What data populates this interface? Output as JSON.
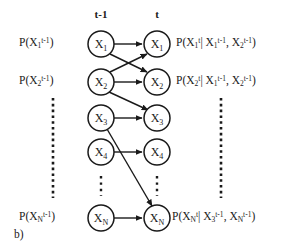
{
  "figure": {
    "caption": "b)",
    "background_color": "#ffffff",
    "stroke_color": "#1a1a1a"
  },
  "time_slices": [
    {
      "id": "previous",
      "label": "t-1",
      "x": 101
    },
    {
      "id": "current",
      "label": "t",
      "x": 157
    }
  ],
  "nodes": {
    "previous_slice": [
      {
        "name": "X",
        "subscript": "1",
        "label": "X₁",
        "cy": 44
      },
      {
        "name": "X",
        "subscript": "2",
        "label": "X₂",
        "cy": 82
      },
      {
        "name": "X",
        "subscript": "3",
        "label": "X₃",
        "cy": 118
      },
      {
        "name": "X",
        "subscript": "4",
        "label": "X₄",
        "cy": 152
      },
      {
        "name": "X",
        "subscript": "N",
        "label": "Xₙ",
        "cy": 218
      }
    ],
    "current_slice": [
      {
        "name": "X",
        "subscript": "1",
        "label": "X₁",
        "cy": 44
      },
      {
        "name": "X",
        "subscript": "2",
        "label": "X₂",
        "cy": 82
      },
      {
        "name": "X",
        "subscript": "3",
        "label": "X₃",
        "cy": 118
      },
      {
        "name": "X",
        "subscript": "4",
        "label": "X₄",
        "cy": 152
      },
      {
        "name": "X",
        "subscript": "N",
        "label": "Xₙ",
        "cy": 218
      }
    ]
  },
  "edges": [
    {
      "from": "X1_prev",
      "to": "X1_cur",
      "kind": "horizontal"
    },
    {
      "from": "X1_prev",
      "to": "X2_cur",
      "kind": "diagonal"
    },
    {
      "from": "X2_prev",
      "to": "X1_cur",
      "kind": "diagonal"
    },
    {
      "from": "X2_prev",
      "to": "X2_cur",
      "kind": "horizontal"
    },
    {
      "from": "X2_prev",
      "to": "X3_cur",
      "kind": "diagonal"
    },
    {
      "from": "X3_prev",
      "to": "X3_cur",
      "kind": "horizontal"
    },
    {
      "from": "X3_prev",
      "to": "XN_cur",
      "kind": "diagonal"
    },
    {
      "from": "X4_prev",
      "to": "X4_cur",
      "kind": "horizontal"
    },
    {
      "from": "XN_prev",
      "to": "XN_cur",
      "kind": "horizontal"
    }
  ],
  "left_labels": [
    {
      "id": "prior-x1",
      "base": "P(X",
      "sub": "1",
      "sup": "t-1",
      "close": ")"
    },
    {
      "id": "prior-x2",
      "base": "P(X",
      "sub": "2",
      "sup": "t-1",
      "close": ")"
    },
    {
      "id": "prior-xn",
      "base": "P(X",
      "sub": "N",
      "sup": "t-1",
      "close": ")"
    }
  ],
  "right_labels": {
    "x1": {
      "open": "P(X",
      "sub": "1",
      "sup": "t",
      "bar": "| X",
      "p1_sub": "1",
      "p1_sup": "t-1",
      "comma": ", X",
      "p2_sub": "2",
      "p2_sup": "t-1",
      "close": ")"
    },
    "x2": {
      "open": "P(X",
      "sub": "2",
      "sup": "t",
      "bar": "| X",
      "p1_sub": "1",
      "p1_sup": "t-1",
      "comma": ", X",
      "p2_sub": "2",
      "p2_sup": "t-1",
      "close": ")"
    },
    "xn": {
      "open": "P(X",
      "sub": "N",
      "sup": "t",
      "bar": "| X",
      "p1_sub": "3",
      "p1_sup": "t-1",
      "comma": ", X",
      "p2_sub": "N",
      "p2_sup": "t-1",
      "close": ")"
    }
  },
  "ellipses": {
    "left_column_x": 53,
    "right_column_x": 221,
    "inner_prev_x": 101,
    "inner_cur_x": 157
  }
}
